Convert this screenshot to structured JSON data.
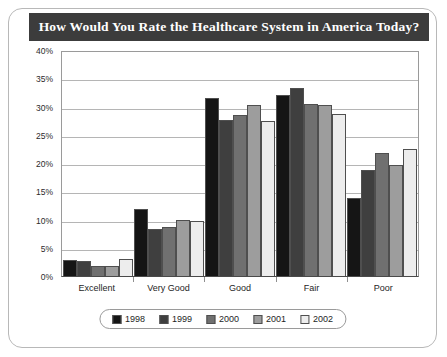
{
  "chart_data": {
    "type": "bar",
    "title": "How Would You Rate the Healthcare System in America Today?",
    "xlabel": "",
    "ylabel": "",
    "ylim": [
      0,
      40
    ],
    "ytick_labels": [
      "40%",
      "35%",
      "30%",
      "25%",
      "20%",
      "15%",
      "10%",
      "5%",
      "0%"
    ],
    "ytick_values": [
      40,
      35,
      30,
      25,
      20,
      15,
      10,
      5,
      0
    ],
    "grid": true,
    "legend_position": "bottom",
    "categories": [
      "Excellent",
      "Very Good",
      "Good",
      "Fair",
      "Poor"
    ],
    "series": [
      {
        "name": "1998",
        "color": "#151515",
        "values": [
          2.8,
          11.8,
          31.5,
          32.0,
          13.8
        ]
      },
      {
        "name": "1999",
        "color": "#3f3f3f",
        "values": [
          2.6,
          8.4,
          27.7,
          33.3,
          18.7
        ]
      },
      {
        "name": "2000",
        "color": "#707070",
        "values": [
          1.8,
          8.6,
          28.5,
          30.4,
          21.7
        ]
      },
      {
        "name": "2001",
        "color": "#9d9d9d",
        "values": [
          1.7,
          9.9,
          30.3,
          30.3,
          19.7
        ]
      },
      {
        "name": "2002",
        "color": "#ededed",
        "values": [
          3.1,
          9.7,
          27.5,
          28.7,
          22.5
        ]
      }
    ]
  },
  "colors": {
    "title_bar": "#3c3c3c",
    "title_text": "#ffffff",
    "frame_border": "#b8b8b8",
    "gridline": "#b5b5b5",
    "axis": "#4a4a4a"
  }
}
